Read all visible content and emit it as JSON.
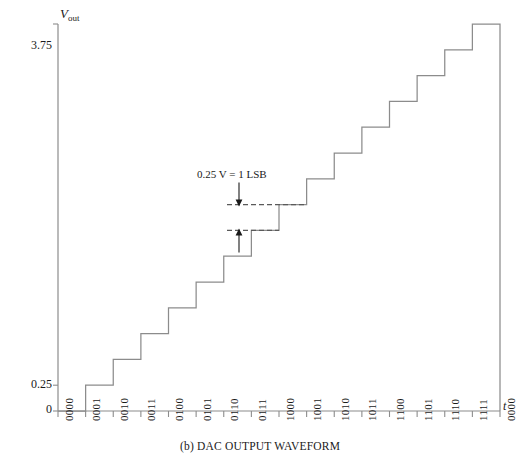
{
  "figure": {
    "caption": "(b) DAC OUTPUT WAVEFORM",
    "annotation": "0.25 V = 1 LSB",
    "y_axis_label_main": "V",
    "y_axis_label_sub": "out",
    "x_axis_label": "t"
  },
  "chart_data": {
    "type": "line",
    "title": "(b) DAC OUTPUT WAVEFORM",
    "xlabel": "t",
    "ylabel": "Vout",
    "grid": false,
    "legend": null,
    "step_style": "staircase",
    "lsb_volts": 0.25,
    "annotation": "0.25 V = 1 LSB",
    "ylim": [
      0,
      3.75
    ],
    "ytick_values": [
      0,
      0.25,
      3.75
    ],
    "ytick_labels": [
      "0",
      "0.25",
      "3.75"
    ],
    "categories": [
      "0000",
      "0001",
      "0010",
      "0011",
      "0100",
      "0101",
      "0110",
      "0111",
      "1000",
      "1001",
      "1010",
      "1011",
      "1100",
      "1101",
      "1110",
      "1111",
      "0000"
    ],
    "values": [
      0,
      0.25,
      0.5,
      0.75,
      1.0,
      1.25,
      1.5,
      1.75,
      2.0,
      2.25,
      2.5,
      2.75,
      3.0,
      3.25,
      3.5,
      3.75,
      0
    ]
  }
}
